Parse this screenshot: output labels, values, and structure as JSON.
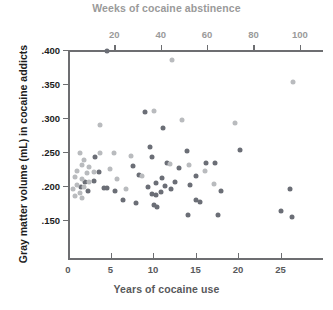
{
  "chart_data": {
    "type": "scatter",
    "title": "",
    "top_axis": {
      "label": "Weeks of cocaine abstinence",
      "ticks": [
        20,
        40,
        60,
        80,
        100
      ],
      "tick_labels": [
        "20",
        "40",
        "60",
        "80",
        "100"
      ],
      "range": [
        0,
        110
      ],
      "color": "#9a9a9a"
    },
    "bottom_axis": {
      "label": "Years of cocaine use",
      "ticks": [
        0,
        5,
        10,
        15,
        20,
        25
      ],
      "tick_labels": [
        "0",
        "5",
        "10",
        "15",
        "20",
        "25"
      ],
      "range": [
        0,
        30
      ],
      "color": "#58595b"
    },
    "y_axis": {
      "label": "Gray matter volume (mL) in cocaine addicts",
      "ticks": [
        0.4,
        0.35,
        0.3,
        0.25,
        0.2,
        0.15
      ],
      "tick_labels": [
        ".400",
        ".350",
        ".300",
        ".250",
        ".200",
        ".150"
      ],
      "range": [
        0.13,
        0.4
      ],
      "color": "#1d1d1d"
    },
    "grid": false,
    "legend": null,
    "series": [
      {
        "name": "Years of cocaine use",
        "color": "#6b6e76",
        "x_axis": "bottom",
        "points": [
          {
            "x": 4.6,
            "y": 0.399
          },
          {
            "x": 9.1,
            "y": 0.309
          },
          {
            "x": 11.2,
            "y": 0.286
          },
          {
            "x": 9.6,
            "y": 0.258
          },
          {
            "x": 9.9,
            "y": 0.243
          },
          {
            "x": 11.6,
            "y": 0.234
          },
          {
            "x": 14.0,
            "y": 0.252
          },
          {
            "x": 13.1,
            "y": 0.226
          },
          {
            "x": 15.1,
            "y": 0.214
          },
          {
            "x": 16.2,
            "y": 0.234
          },
          {
            "x": 7.6,
            "y": 0.229
          },
          {
            "x": 8.4,
            "y": 0.216
          },
          {
            "x": 3.2,
            "y": 0.243
          },
          {
            "x": 3.6,
            "y": 0.221
          },
          {
            "x": 3.0,
            "y": 0.208
          },
          {
            "x": 4.2,
            "y": 0.197
          },
          {
            "x": 4.6,
            "y": 0.197
          },
          {
            "x": 5.5,
            "y": 0.192
          },
          {
            "x": 2.0,
            "y": 0.206
          },
          {
            "x": 2.3,
            "y": 0.193
          },
          {
            "x": 1.5,
            "y": 0.198
          },
          {
            "x": 10.3,
            "y": 0.204
          },
          {
            "x": 11.0,
            "y": 0.212
          },
          {
            "x": 11.4,
            "y": 0.2
          },
          {
            "x": 12.1,
            "y": 0.196
          },
          {
            "x": 12.6,
            "y": 0.206
          },
          {
            "x": 10.9,
            "y": 0.191
          },
          {
            "x": 9.4,
            "y": 0.198
          },
          {
            "x": 9.9,
            "y": 0.188
          },
          {
            "x": 10.4,
            "y": 0.187
          },
          {
            "x": 10.1,
            "y": 0.172
          },
          {
            "x": 10.5,
            "y": 0.169
          },
          {
            "x": 14.4,
            "y": 0.202
          },
          {
            "x": 15.1,
            "y": 0.18
          },
          {
            "x": 15.5,
            "y": 0.176
          },
          {
            "x": 14.1,
            "y": 0.158
          },
          {
            "x": 17.6,
            "y": 0.157
          },
          {
            "x": 17.3,
            "y": 0.234
          },
          {
            "x": 18.0,
            "y": 0.192
          },
          {
            "x": 20.2,
            "y": 0.253
          },
          {
            "x": 25.0,
            "y": 0.163
          },
          {
            "x": 26.3,
            "y": 0.155
          },
          {
            "x": 26.1,
            "y": 0.196
          },
          {
            "x": 8.0,
            "y": 0.175
          },
          {
            "x": 6.5,
            "y": 0.18
          }
        ]
      },
      {
        "name": "Weeks of cocaine abstinence",
        "color": "#b9bbbe",
        "x_axis": "top",
        "points": [
          {
            "x": 45,
            "y": 0.386
          },
          {
            "x": 37,
            "y": 0.31
          },
          {
            "x": 49,
            "y": 0.297
          },
          {
            "x": 72,
            "y": 0.293
          },
          {
            "x": 97,
            "y": 0.353
          },
          {
            "x": 14,
            "y": 0.289
          },
          {
            "x": 20,
            "y": 0.248
          },
          {
            "x": 27,
            "y": 0.244
          },
          {
            "x": 5,
            "y": 0.249
          },
          {
            "x": 7,
            "y": 0.238
          },
          {
            "x": 6,
            "y": 0.231
          },
          {
            "x": 9,
            "y": 0.228
          },
          {
            "x": 4,
            "y": 0.222
          },
          {
            "x": 8,
            "y": 0.219
          },
          {
            "x": 11,
            "y": 0.221
          },
          {
            "x": 3,
            "y": 0.213
          },
          {
            "x": 6,
            "y": 0.21
          },
          {
            "x": 9,
            "y": 0.206
          },
          {
            "x": 4,
            "y": 0.202
          },
          {
            "x": 7,
            "y": 0.199
          },
          {
            "x": 2,
            "y": 0.196
          },
          {
            "x": 5,
            "y": 0.19
          },
          {
            "x": 3,
            "y": 0.186
          },
          {
            "x": 6,
            "y": 0.183
          },
          {
            "x": 18,
            "y": 0.225
          },
          {
            "x": 21,
            "y": 0.211
          },
          {
            "x": 25,
            "y": 0.196
          },
          {
            "x": 32,
            "y": 0.215
          },
          {
            "x": 44,
            "y": 0.232
          },
          {
            "x": 52,
            "y": 0.231
          },
          {
            "x": 59,
            "y": 0.222
          },
          {
            "x": 63,
            "y": 0.203
          },
          {
            "x": 14,
            "y": 0.248
          }
        ]
      }
    ]
  }
}
